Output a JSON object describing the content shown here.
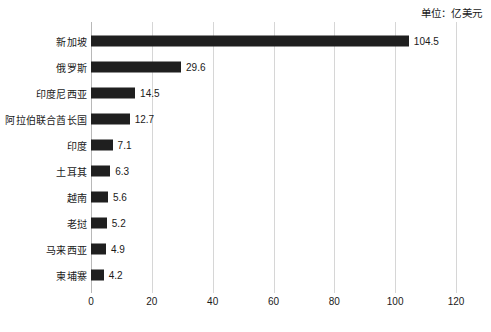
{
  "annotation": {
    "unit_note": "单位：亿美元"
  },
  "chart_data": {
    "type": "bar",
    "orientation": "horizontal",
    "title": "",
    "subtitle": "",
    "xlabel": "",
    "ylabel": "",
    "unit_note": "单位：亿美元",
    "categories": [
      "新加坡",
      "俄罗斯",
      "印度尼西亚",
      "阿拉伯联合酋长国",
      "印度",
      "土耳其",
      "越南",
      "老挝",
      "马来西亚",
      "柬埔寨"
    ],
    "values": [
      104.5,
      29.6,
      14.5,
      12.7,
      7.1,
      6.3,
      5.6,
      5.2,
      4.9,
      4.2
    ],
    "value_labels": [
      "104.5",
      "29.6",
      "14.5",
      "12.7",
      "7.1",
      "6.3",
      "5.6",
      "5.2",
      "4.9",
      "4.2"
    ],
    "xlim": [
      0,
      120
    ],
    "xticks": [
      0,
      20,
      40,
      60,
      80,
      100,
      120
    ],
    "xtick_labels": [
      "0",
      "20",
      "40",
      "60",
      "80",
      "100",
      "120"
    ],
    "grid": "vertical",
    "legend": "none",
    "bar_color": "#1f1f1f",
    "gridline_color": "#d6d6d6",
    "background_color": "#ffffff"
  }
}
